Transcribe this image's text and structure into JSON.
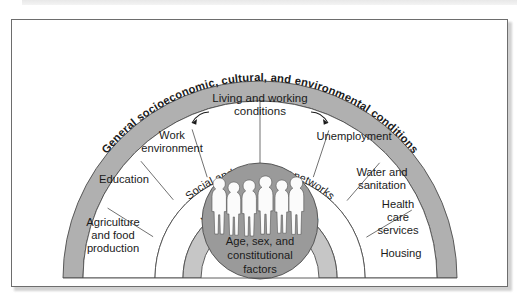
{
  "figure": {
    "colors": {
      "outer_band": "#b0b0b0",
      "ring_white": "#ffffff",
      "lifestyle_ring": "#c6c6c6",
      "core_circle": "#9a9a9a",
      "outline": "#4d4d4d",
      "text": "#1a1a1a",
      "figure_fill": "#f2f2f2",
      "frame_border": "#6d6d6d",
      "page_background": "#ffffff"
    },
    "bands": {
      "outer": {
        "name": "general-conditions-band",
        "label": "General socioeconomic, cultural, and environmental conditions"
      },
      "living_working": {
        "name": "living-and-working-conditions-band",
        "label_line1": "Living and working",
        "label_line2": "conditions",
        "label": "Living and working conditions",
        "arrow_left": "arrow-left",
        "arrow_right": "arrow-right",
        "segments": [
          {
            "id": "agriculture",
            "label": "Agriculture and food production",
            "lines": [
              "Agriculture",
              "and food",
              "production"
            ]
          },
          {
            "id": "education",
            "label": "Education",
            "lines": [
              "Education"
            ]
          },
          {
            "id": "work-environment",
            "label": "Work environment",
            "lines": [
              "Work",
              "environment"
            ]
          },
          {
            "id": "unemployment",
            "label": "Unemployment",
            "lines": [
              "Unemployment"
            ]
          },
          {
            "id": "water-and-sanitation",
            "label": "Water and sanitation",
            "lines": [
              "Water and",
              "sanitation"
            ]
          },
          {
            "id": "health-care-services",
            "label": "Health care services",
            "lines": [
              "Health",
              "care",
              "services"
            ]
          },
          {
            "id": "housing",
            "label": "Housing",
            "lines": [
              "Housing"
            ]
          }
        ]
      },
      "social": {
        "name": "social-and-community-networks-band",
        "label": "Social and community networks"
      },
      "lifestyle": {
        "name": "individual-lifestyle-factors-band",
        "label": "Individual lifestyle factors"
      },
      "core": {
        "name": "core-constitutional-factors",
        "lines": [
          "Age, sex, and",
          "constitutional",
          "factors"
        ],
        "label": "Age, sex, and constitutional factors",
        "people_count": 6,
        "people_icon": "people-silhouettes-icon"
      }
    }
  }
}
